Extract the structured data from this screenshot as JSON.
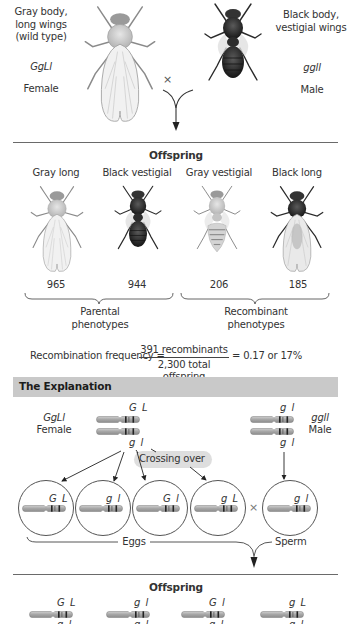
{
  "parents": {
    "female": {
      "phenotype_lines": [
        "Gray body,",
        "long wings",
        "(wild type)"
      ],
      "genotype": "GgLl",
      "sex": "Female",
      "body_color": "#cfcfcf"
    },
    "cross_symbol": "×",
    "male": {
      "phenotype_lines": [
        "Black body,",
        "vestigial wings"
      ],
      "genotype": "ggll",
      "sex": "Male",
      "body_color": "#2e2e2e"
    }
  },
  "offspring_section": {
    "title": "Offspring",
    "phenotypes": [
      {
        "label": "Gray long",
        "count": "965",
        "type": "parental"
      },
      {
        "label": "Black vestigial",
        "count": "944",
        "type": "parental"
      },
      {
        "label": "Gray vestigial",
        "count": "206",
        "type": "recombinant"
      },
      {
        "label": "Black long",
        "count": "185",
        "type": "recombinant"
      }
    ],
    "groups": [
      {
        "lines": [
          "Parental",
          "phenotypes"
        ]
      },
      {
        "lines": [
          "Recombinant",
          "phenotypes"
        ]
      }
    ],
    "formula": {
      "lhs": "Recombination frequency =",
      "numerator": "391 recombinants",
      "denominator": "2,300 total offspring",
      "rhs": "= 0.17 or 17%"
    }
  },
  "explanation": {
    "banner": "The Explanation",
    "banner_color": "#c9c9c9",
    "female": {
      "genotype": "GgLl",
      "sex": "Female",
      "top_alleles": "G L",
      "bottom_alleles": "g l"
    },
    "male": {
      "genotype": "ggll",
      "sex": "Male",
      "top_alleles": "g l",
      "bottom_alleles": "g l"
    },
    "crossing_over_label": "Crossing over",
    "gametes": [
      {
        "alleles": "G L",
        "kind": "egg"
      },
      {
        "alleles": "g l",
        "kind": "egg"
      },
      {
        "alleles": "G l",
        "kind": "egg"
      },
      {
        "alleles": "g L",
        "kind": "egg"
      },
      {
        "alleles": "g l",
        "kind": "sperm"
      }
    ],
    "gamete_cross_symbol": "×",
    "eggs_label": "Eggs",
    "sperm_label": "Sperm"
  },
  "offspring_bottom": {
    "title": "Offspring",
    "genotypes": [
      {
        "top": "G L",
        "bottom": "g l"
      },
      {
        "top": "g l",
        "bottom": "g l"
      },
      {
        "top": "G l",
        "bottom": "g l"
      },
      {
        "top": "g L",
        "bottom": "g l"
      }
    ]
  },
  "colors": {
    "chromosome": "#a9a9a9",
    "band": "#222222",
    "rule": "#6a6a6a"
  }
}
